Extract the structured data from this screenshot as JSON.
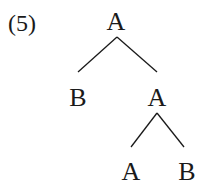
{
  "example_number": "(5)",
  "tree": {
    "root": {
      "label": "A",
      "x": 116,
      "y": 22
    },
    "left_child": {
      "label": "B",
      "x": 78,
      "y": 98
    },
    "right_child": {
      "label": "A",
      "x": 157,
      "y": 98
    },
    "right_left_grandchild": {
      "label": "A",
      "x": 131,
      "y": 172
    },
    "right_right_grandchild": {
      "label": "B",
      "x": 187,
      "y": 172
    }
  },
  "edges": [
    {
      "from": "root",
      "to": "left_child"
    },
    {
      "from": "root",
      "to": "right_child"
    },
    {
      "from": "right_child",
      "to": "right_left_grandchild"
    },
    {
      "from": "right_child",
      "to": "right_right_grandchild"
    }
  ]
}
